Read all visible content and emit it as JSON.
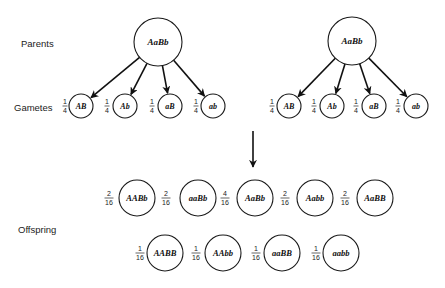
{
  "labels": {
    "parents": "Parents",
    "gametes": "Gametes",
    "offspring": "Offspring"
  },
  "parents": [
    {
      "genotype": "AaBb",
      "cx": 158,
      "cy": 42,
      "r": 24
    },
    {
      "genotype": "AaBb",
      "cx": 352,
      "cy": 41,
      "r": 24
    }
  ],
  "gametes": {
    "left": [
      {
        "genotype": "AB",
        "num": "1",
        "den": "4",
        "cx": 81,
        "fx": 65
      },
      {
        "genotype": "Ab",
        "num": "1",
        "den": "4",
        "cx": 125,
        "fx": 107
      },
      {
        "genotype": "aB",
        "num": "1",
        "den": "4",
        "cx": 170,
        "fx": 152
      },
      {
        "genotype": "ab",
        "num": "1",
        "den": "4",
        "cx": 213,
        "fx": 196
      }
    ],
    "right": [
      {
        "genotype": "AB",
        "num": "1",
        "den": "4",
        "cx": 289,
        "fx": 272
      },
      {
        "genotype": "Ab",
        "num": "1",
        "den": "4",
        "cx": 332,
        "fx": 314
      },
      {
        "genotype": "aB",
        "num": "1",
        "den": "4",
        "cx": 374,
        "fx": 356
      },
      {
        "genotype": "ab",
        "num": "1",
        "den": "4",
        "cx": 416,
        "fx": 398
      }
    ]
  },
  "offspring": {
    "row1": [
      {
        "genotype": "AABb",
        "num": "2",
        "den": "16",
        "cx": 137,
        "fx": 109
      },
      {
        "genotype": "aaBb",
        "num": "2",
        "den": "16",
        "cx": 198,
        "fx": 166
      },
      {
        "genotype": "AaBb",
        "num": "4",
        "den": "16",
        "cx": 255,
        "fx": 225
      },
      {
        "genotype": "Aabb",
        "num": "2",
        "den": "16",
        "cx": 315,
        "fx": 285
      },
      {
        "genotype": "AaBB",
        "num": "2",
        "den": "16",
        "cx": 375,
        "fx": 345
      }
    ],
    "row2": [
      {
        "genotype": "AABB",
        "num": "1",
        "den": "16",
        "cx": 165,
        "fx": 140
      },
      {
        "genotype": "AAbb",
        "num": "1",
        "den": "16",
        "cx": 223,
        "fx": 196
      },
      {
        "genotype": "aaBB",
        "num": "1",
        "den": "16",
        "cx": 282,
        "fx": 256
      },
      {
        "genotype": "aabb",
        "num": "1",
        "den": "16",
        "cx": 341,
        "fx": 316
      }
    ]
  }
}
